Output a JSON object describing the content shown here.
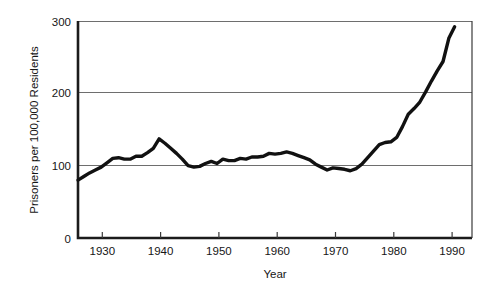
{
  "chart_data": {
    "type": "line",
    "title": "",
    "subtitle": "",
    "xlabel": "Year",
    "ylabel": "Prisoners per 100,000 Residents",
    "xlim": [
      1925,
      1993
    ],
    "ylim": [
      0,
      300
    ],
    "grid": "horizontal",
    "legend": "none",
    "x_ticks": [
      1930,
      1940,
      1950,
      1960,
      1970,
      1980,
      1990
    ],
    "x_tick_labels": [
      "1930",
      "1940",
      "1950",
      "1960",
      "1970",
      "1980",
      "1990"
    ],
    "y_ticks": [
      0,
      100,
      200,
      300
    ],
    "y_tick_labels": [
      "0",
      "100",
      "200",
      "300"
    ],
    "series": [
      {
        "name": "Prisoners per 100,000 Residents",
        "color": "#111111",
        "x": [
          1925,
          1926,
          1927,
          1928,
          1929,
          1930,
          1931,
          1932,
          1933,
          1934,
          1935,
          1936,
          1937,
          1938,
          1939,
          1940,
          1941,
          1942,
          1943,
          1944,
          1945,
          1946,
          1947,
          1948,
          1949,
          1950,
          1951,
          1952,
          1953,
          1954,
          1955,
          1956,
          1957,
          1958,
          1959,
          1960,
          1961,
          1962,
          1963,
          1964,
          1965,
          1966,
          1967,
          1968,
          1969,
          1970,
          1971,
          1972,
          1973,
          1974,
          1975,
          1976,
          1977,
          1978,
          1979,
          1980,
          1981,
          1982,
          1983,
          1984,
          1985,
          1986,
          1987,
          1988,
          1989,
          1990
        ],
        "y": [
          80,
          85,
          90,
          94,
          98,
          104,
          110,
          111,
          109,
          109,
          113,
          113,
          118,
          124,
          137,
          131,
          124,
          117,
          109,
          100,
          98,
          99,
          103,
          106,
          103,
          109,
          107,
          107,
          110,
          109,
          112,
          112,
          113,
          117,
          116,
          117,
          119,
          117,
          114,
          111,
          108,
          102,
          98,
          94,
          97,
          96,
          95,
          93,
          96,
          102,
          111,
          120,
          129,
          132,
          133,
          139,
          154,
          171,
          179,
          188,
          202,
          217,
          231,
          244,
          276,
          292
        ]
      }
    ],
    "annotations": []
  }
}
